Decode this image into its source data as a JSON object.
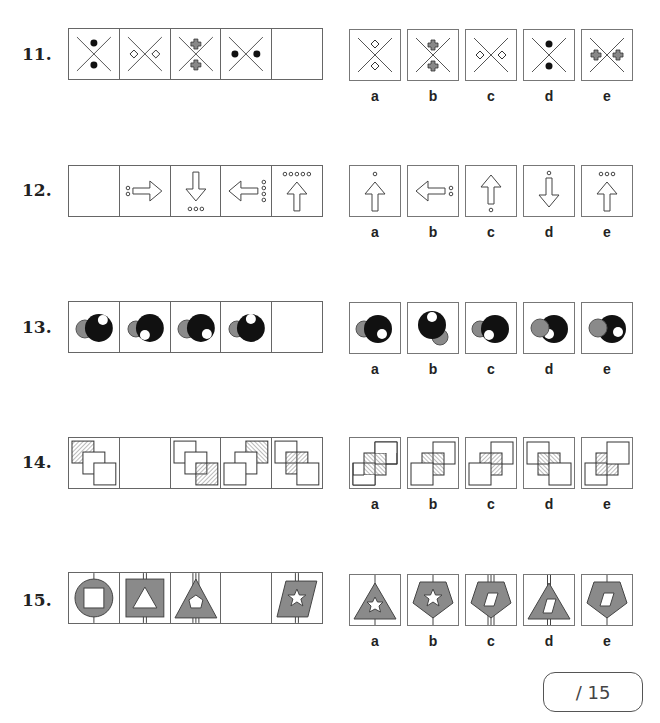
{
  "questions": [
    {
      "number": "11.",
      "sequence_cells": [
        "x-dots-vertical",
        "x-diamonds-horizontal",
        "x-crosses-vertical",
        "x-dots-horizontal",
        "blank"
      ],
      "options": [
        "a",
        "b",
        "c",
        "d",
        "e"
      ],
      "option_figures": [
        "x-diamonds-vertical",
        "x-crosses-vertical",
        "x-diamonds-horizontal",
        "x-dots-vertical",
        "x-crosses-horizontal"
      ]
    },
    {
      "number": "12.",
      "sequence_cells": [
        "blank",
        "arrow-right-2dots-left",
        "arrow-down-3dots-below",
        "arrow-left-4dots-right",
        "arrow-up-5dots-above"
      ],
      "options": [
        "a",
        "b",
        "c",
        "d",
        "e"
      ],
      "option_figures": [
        "arrow-up-1dot-above",
        "arrow-left-2dots-right",
        "arrow-up-1dot-below",
        "arrow-down-1dot-above",
        "arrow-up-3dots-above"
      ]
    },
    {
      "number": "13.",
      "sequence_cells": [
        "white-top-right",
        "white-bottom-left",
        "white-bottom-right",
        "white-top",
        "blank"
      ],
      "options": [
        "a",
        "b",
        "c",
        "d",
        "e"
      ],
      "option_figures": [
        "white-bottom-right",
        "grey-bottom-right-white-top",
        "white-bottom-left",
        "white-left-under-grey",
        "white-right"
      ]
    },
    {
      "number": "14.",
      "sequence_cells": [
        "hatch-top-left",
        "blank",
        "hatch-bottom-right",
        "hatch-top-right",
        "hatch-middle"
      ],
      "options": [
        "a",
        "b",
        "c",
        "d",
        "e"
      ],
      "option_figures": [
        "a",
        "b",
        "c",
        "d",
        "e"
      ]
    },
    {
      "number": "15.",
      "sequence_cells": [
        "circle-square-1line",
        "square-triangle-2lines",
        "triangle-pentagon-3lines",
        "blank",
        "parallelogram-star-2lines"
      ],
      "options": [
        "a",
        "b",
        "c",
        "d",
        "e"
      ],
      "option_figures": [
        "triangle-star-1line",
        "pentagon-star-1line",
        "pentagon-parallelogram-3lines",
        "triangle-parallelogram-2lines",
        "pentagon-parallelogram-1line"
      ]
    }
  ],
  "score": {
    "label": "/ 15"
  },
  "colors": {
    "grey_fill": "#8a8a8a",
    "black": "#111111",
    "line": "#555555"
  }
}
